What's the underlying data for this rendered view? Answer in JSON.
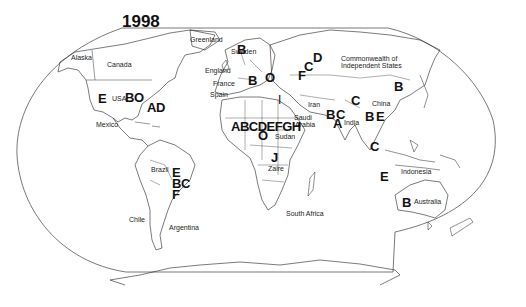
{
  "map": {
    "title": "1998",
    "projection": "world outline (Robinson-style)",
    "countries": [
      {
        "name": "Greenland",
        "x": 190,
        "y": 36
      },
      {
        "name": "Alaska",
        "x": 71,
        "y": 54
      },
      {
        "name": "Canada",
        "x": 107,
        "y": 61
      },
      {
        "name": "Sweden",
        "x": 231,
        "y": 48
      },
      {
        "name": "England",
        "x": 205,
        "y": 67
      },
      {
        "name": "France",
        "x": 213,
        "y": 80
      },
      {
        "name": "Spain",
        "x": 210,
        "y": 91
      },
      {
        "name": "USA",
        "x": 104,
        "y": 95
      },
      {
        "name": "Mexico",
        "x": 96,
        "y": 121
      },
      {
        "name": "Commonwealth of",
        "x": 341,
        "y": 55
      },
      {
        "name": "Independent States",
        "x": 341,
        "y": 62
      },
      {
        "name": "Iran",
        "x": 309,
        "y": 101
      },
      {
        "name": "China",
        "x": 372,
        "y": 100
      },
      {
        "name": "Saudi",
        "x": 294,
        "y": 114
      },
      {
        "name": "Arabia",
        "x": 294,
        "y": 121
      },
      {
        "name": "India",
        "x": 344,
        "y": 119
      },
      {
        "name": "Sudan",
        "x": 276,
        "y": 133
      },
      {
        "name": "Zaire",
        "x": 268,
        "y": 165
      },
      {
        "name": "Indonesia",
        "x": 401,
        "y": 169
      },
      {
        "name": "Brazil",
        "x": 151,
        "y": 166
      },
      {
        "name": "Australia",
        "x": 413,
        "y": 198
      },
      {
        "name": "Chile",
        "x": 129,
        "y": 216
      },
      {
        "name": "Argentina",
        "x": 169,
        "y": 224
      },
      {
        "name": "South Africa",
        "x": 286,
        "y": 210
      }
    ],
    "codes": [
      {
        "text": "B",
        "x": 237,
        "y": 44,
        "region": "Sweden"
      },
      {
        "text": "D",
        "x": 313,
        "y": 52,
        "region": "CIS"
      },
      {
        "text": "C",
        "x": 305,
        "y": 61,
        "region": "CIS"
      },
      {
        "text": "F",
        "x": 297,
        "y": 69,
        "region": "CIS"
      },
      {
        "text": "B",
        "x": 250,
        "y": 75,
        "region": "Europe"
      },
      {
        "text": "O",
        "x": 266,
        "y": 71,
        "region": "Europe"
      },
      {
        "text": "B",
        "x": 394,
        "y": 80,
        "region": "East Asia"
      },
      {
        "text": "E",
        "x": 99,
        "y": 92,
        "region": "USA"
      },
      {
        "text": "BO",
        "x": 125,
        "y": 91,
        "region": "USA"
      },
      {
        "text": "AD",
        "x": 146,
        "y": 101,
        "region": "USA East"
      },
      {
        "text": "C",
        "x": 351,
        "y": 94,
        "region": "China"
      },
      {
        "text": "B",
        "x": 327,
        "y": 109,
        "region": "Pakistan"
      },
      {
        "text": "C",
        "x": 337,
        "y": 109,
        "region": "India"
      },
      {
        "text": "A",
        "x": 333,
        "y": 118,
        "region": "India"
      },
      {
        "text": "B",
        "x": 365,
        "y": 111,
        "region": "Bangladesh"
      },
      {
        "text": "E",
        "x": 375,
        "y": 111,
        "region": "Myanmar"
      },
      {
        "text": "ABCDEFGH",
        "x": 232,
        "y": 121,
        "region": "West Africa"
      },
      {
        "text": "O",
        "x": 258,
        "y": 130,
        "region": "West Africa"
      },
      {
        "text": "I",
        "x": 278,
        "y": 95,
        "region": "Egypt"
      },
      {
        "text": "C",
        "x": 370,
        "y": 140,
        "region": "Southeast Asia"
      },
      {
        "text": "J",
        "x": 271,
        "y": 152,
        "region": "Zaire"
      },
      {
        "text": "E",
        "x": 380,
        "y": 170,
        "region": "Indonesia"
      },
      {
        "text": "B",
        "x": 402,
        "y": 197,
        "region": "Australia"
      }
    ],
    "brazil_codes": {
      "lines": [
        "E",
        "BC",
        "F"
      ],
      "x": 172,
      "y": 168
    }
  }
}
